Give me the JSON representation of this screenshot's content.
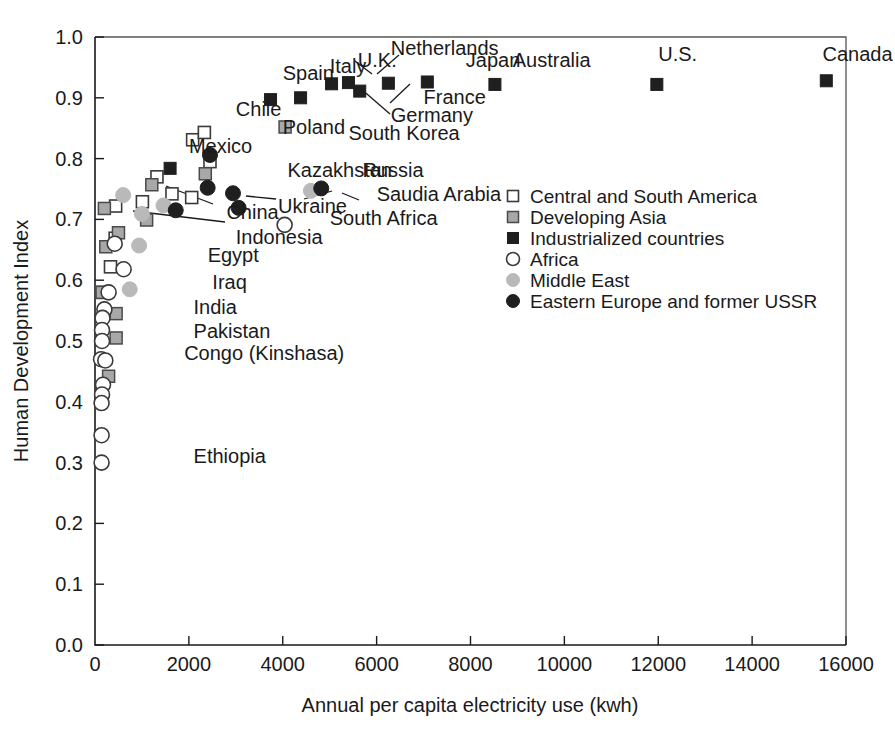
{
  "chart_data": {
    "type": "scatter",
    "title": "",
    "xlabel": "Annual per capita electricity use (kwh)",
    "ylabel": "Human Development Index",
    "xlim": [
      0,
      16000
    ],
    "ylim": [
      0.0,
      1.0
    ],
    "xticks": [
      0,
      2000,
      4000,
      6000,
      8000,
      10000,
      12000,
      14000,
      16000
    ],
    "xticklabels": [
      "0",
      "2000",
      "4000",
      "6000",
      "8000",
      "10000",
      "12000",
      "14000",
      "16000"
    ],
    "yticks": [
      0.0,
      0.1,
      0.2,
      0.3,
      0.4,
      0.5,
      0.6,
      0.7,
      0.8,
      0.9,
      1.0
    ],
    "yticklabels": [
      "0.0",
      "0.1",
      "0.2",
      "0.3",
      "0.4",
      "0.5",
      "0.6",
      "0.7",
      "0.8",
      "0.9",
      "1.0"
    ],
    "grid": false,
    "legend_position": "center-right",
    "legend": [
      {
        "label": "Central and South America",
        "marker": "open-square",
        "color": "#ffffff"
      },
      {
        "label": "Developing Asia",
        "marker": "grey-square",
        "color": "#a8a8a8"
      },
      {
        "label": "Industrialized countries",
        "marker": "black-square",
        "color": "#1f1f1f"
      },
      {
        "label": "Africa",
        "marker": "open-circle",
        "color": "#ffffff"
      },
      {
        "label": "Middle East",
        "marker": "grey-circle",
        "color": "#b9b9b9"
      },
      {
        "label": "Eastern Europe and former USSR",
        "marker": "black-circle",
        "color": "#1f1f1f"
      }
    ],
    "series": [
      {
        "name": "Central and South America",
        "marker": "open-square",
        "points": [
          {
            "label": "Chile",
            "x": 2080,
            "y": 0.831
          },
          {
            "label": "",
            "x": 2330,
            "y": 0.843
          },
          {
            "label": "",
            "x": 1320,
            "y": 0.77
          },
          {
            "label": "",
            "x": 1640,
            "y": 0.742
          },
          {
            "label": "",
            "x": 1010,
            "y": 0.729
          },
          {
            "label": "",
            "x": 2060,
            "y": 0.736
          },
          {
            "label": "",
            "x": 2450,
            "y": 0.795
          },
          {
            "label": "",
            "x": 440,
            "y": 0.722
          },
          {
            "label": "",
            "x": 430,
            "y": 0.669
          },
          {
            "label": "",
            "x": 330,
            "y": 0.622
          },
          {
            "label": "",
            "x": 170,
            "y": 0.58
          }
        ]
      },
      {
        "name": "Developing Asia",
        "marker": "grey-square",
        "points": [
          {
            "label": "South Korea",
            "x": 4050,
            "y": 0.852
          },
          {
            "label": "",
            "x": 2350,
            "y": 0.775
          },
          {
            "label": "",
            "x": 1210,
            "y": 0.757
          },
          {
            "label": "China",
            "x": 1100,
            "y": 0.699
          },
          {
            "label": "Indonesia",
            "x": 500,
            "y": 0.678
          },
          {
            "label": "",
            "x": 200,
            "y": 0.718
          },
          {
            "label": "",
            "x": 230,
            "y": 0.655
          },
          {
            "label": "",
            "x": 150,
            "y": 0.58
          },
          {
            "label": "India",
            "x": 450,
            "y": 0.545
          },
          {
            "label": "Pakistan",
            "x": 450,
            "y": 0.505
          },
          {
            "label": "",
            "x": 290,
            "y": 0.442
          }
        ]
      },
      {
        "name": "Industrialized countries",
        "marker": "black-square",
        "points": [
          {
            "label": "Canada",
            "x": 15580,
            "y": 0.928
          },
          {
            "label": "U.S.",
            "x": 11970,
            "y": 0.922
          },
          {
            "label": "Australia",
            "x": 8520,
            "y": 0.922
          },
          {
            "label": "Japan",
            "x": 7080,
            "y": 0.926
          },
          {
            "label": "France",
            "x": 6250,
            "y": 0.924
          },
          {
            "label": "Germany",
            "x": 5640,
            "y": 0.911
          },
          {
            "label": "Netherlands",
            "x": 5400,
            "y": 0.925
          },
          {
            "label": "U.K.",
            "x": 5040,
            "y": 0.923
          },
          {
            "label": "Italy",
            "x": 4380,
            "y": 0.9
          },
          {
            "label": "Spain",
            "x": 3740,
            "y": 0.897
          },
          {
            "label": "Mexico",
            "x": 1600,
            "y": 0.784
          }
        ]
      },
      {
        "name": "Africa",
        "marker": "open-circle",
        "points": [
          {
            "label": "South Africa",
            "x": 4040,
            "y": 0.691
          },
          {
            "label": "Egypt",
            "x": 610,
            "y": 0.618
          },
          {
            "label": "",
            "x": 420,
            "y": 0.66
          },
          {
            "label": "",
            "x": 290,
            "y": 0.58
          },
          {
            "label": "",
            "x": 200,
            "y": 0.552
          },
          {
            "label": "",
            "x": 160,
            "y": 0.538
          },
          {
            "label": "",
            "x": 150,
            "y": 0.518
          },
          {
            "label": "",
            "x": 150,
            "y": 0.5
          },
          {
            "label": "Congo (Kinshasa)",
            "x": 130,
            "y": 0.47
          },
          {
            "label": "",
            "x": 220,
            "y": 0.468
          },
          {
            "label": "",
            "x": 170,
            "y": 0.428
          },
          {
            "label": "",
            "x": 150,
            "y": 0.412
          },
          {
            "label": "",
            "x": 140,
            "y": 0.398
          },
          {
            "label": "",
            "x": 140,
            "y": 0.345
          },
          {
            "label": "Ethiopia",
            "x": 140,
            "y": 0.3
          }
        ]
      },
      {
        "name": "Middle East",
        "marker": "grey-circle",
        "points": [
          {
            "label": "Saudia Arabia",
            "x": 4600,
            "y": 0.747
          },
          {
            "label": "",
            "x": 1460,
            "y": 0.723
          },
          {
            "label": "",
            "x": 1000,
            "y": 0.709
          },
          {
            "label": "",
            "x": 600,
            "y": 0.74
          },
          {
            "label": "",
            "x": 940,
            "y": 0.657
          },
          {
            "label": "Iraq",
            "x": 740,
            "y": 0.585
          }
        ]
      },
      {
        "name": "Eastern Europe and former USSR",
        "marker": "black-circle",
        "points": [
          {
            "label": "Poland",
            "x": 2450,
            "y": 0.806
          },
          {
            "label": "Russia",
            "x": 4820,
            "y": 0.751
          },
          {
            "label": "Kazakhstan",
            "x": 2400,
            "y": 0.752
          },
          {
            "label": "",
            "x": 2940,
            "y": 0.743
          },
          {
            "label": "Ukraine",
            "x": 3060,
            "y": 0.719
          },
          {
            "label": "",
            "x": 1720,
            "y": 0.715
          }
        ]
      }
    ],
    "annotations": [
      {
        "text": "Netherlands",
        "x": 0.63,
        "y": 0.97
      },
      {
        "text": "U.K.",
        "x": 0.56,
        "y": 0.95
      },
      {
        "text": "Japan",
        "x": 0.79,
        "y": 0.95
      },
      {
        "text": "Australia",
        "x": 0.89,
        "y": 0.95
      },
      {
        "text": "U.S.",
        "x": 1.2,
        "y": 0.96
      },
      {
        "text": "Canada",
        "x": 1.55,
        "y": 0.96
      },
      {
        "text": "Spain",
        "x": 0.4,
        "y": 0.93
      },
      {
        "text": "Italy",
        "x": 0.5,
        "y": 0.94
      },
      {
        "text": "France",
        "x": 0.7,
        "y": 0.89
      },
      {
        "text": "Germany",
        "x": 0.63,
        "y": 0.86
      },
      {
        "text": "Chile",
        "x": 0.3,
        "y": 0.87
      },
      {
        "text": "Poland",
        "x": 0.4,
        "y": 0.84
      },
      {
        "text": "South Korea",
        "x": 0.54,
        "y": 0.83
      },
      {
        "text": "Mexico",
        "x": 0.2,
        "y": 0.81
      },
      {
        "text": "Kazakhstan",
        "x": 0.41,
        "y": 0.77
      },
      {
        "text": "Russia",
        "x": 0.57,
        "y": 0.77
      },
      {
        "text": "Saudia Arabia",
        "x": 0.6,
        "y": 0.73
      },
      {
        "text": "Ukraine",
        "x": 0.39,
        "y": 0.71
      },
      {
        "text": "China",
        "x": 0.28,
        "y": 0.7
      },
      {
        "text": "South Africa",
        "x": 0.5,
        "y": 0.69
      },
      {
        "text": "Indonesia",
        "x": 0.3,
        "y": 0.66
      },
      {
        "text": "Egypt",
        "x": 0.24,
        "y": 0.63
      },
      {
        "text": "Iraq",
        "x": 0.25,
        "y": 0.585
      },
      {
        "text": "India",
        "x": 0.21,
        "y": 0.545
      },
      {
        "text": "Pakistan",
        "x": 0.21,
        "y": 0.505
      },
      {
        "text": "Congo (Kinshasa)",
        "x": 0.19,
        "y": 0.468
      },
      {
        "text": "Ethiopia",
        "x": 0.21,
        "y": 0.3
      }
    ]
  }
}
